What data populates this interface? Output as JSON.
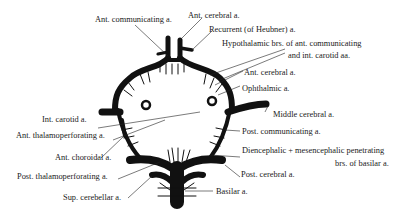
{
  "diagram": {
    "colors": {
      "vessel": "#111111",
      "leader": "#222222",
      "text": "#1a1a1a",
      "background": "#ffffff"
    },
    "labels": {
      "ant_communicating": "Ant. communicating a.",
      "ant_cerebral_top": "Ant. cerebral a.",
      "recurrent_heubner": "Recurrent (of Heubner) a.",
      "hypothalamic_1": "Hypothalamic brs. of ant. communicating",
      "hypothalamic_2": "and int. carotid aa.",
      "ant_cerebral_side": "Ant. cerebral a.",
      "ophthalmic": "Ophthalmic a.",
      "int_carotid": "Int. carotid a.",
      "middle_cerebral": "Middle cerebral a.",
      "ant_thalamoperforating": "Ant. thalamoperforating a.",
      "post_communicating": "Post. communicating a.",
      "ant_choroidal": "Ant. choroidal a.",
      "diencephalic_1": "Diencephalic + mesencephalic penetrating",
      "diencephalic_2": "brs. of basilar a.",
      "post_thalamoperforating": "Post. thalamoperforating a.",
      "post_cerebral": "Post. cerebral a.",
      "sup_cerebellar": "Sup. cerebellar a.",
      "basilar": "Basilar a."
    }
  }
}
